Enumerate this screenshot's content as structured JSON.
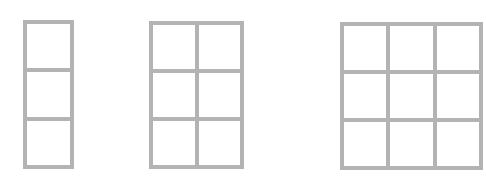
{
  "diagram": {
    "type": "grid-rectangles",
    "line_color": "#b3b3b3",
    "background": "#ffffff",
    "grids": [
      {
        "name": "grid-1x3",
        "cols": 1,
        "rows": 3,
        "x": 23,
        "y": 20,
        "w": 51,
        "h": 149
      },
      {
        "name": "grid-2x3",
        "cols": 2,
        "rows": 3,
        "x": 149,
        "y": 21,
        "w": 95,
        "h": 148
      },
      {
        "name": "grid-3x3",
        "cols": 3,
        "rows": 3,
        "x": 340,
        "y": 22,
        "w": 143,
        "h": 148
      }
    ]
  }
}
